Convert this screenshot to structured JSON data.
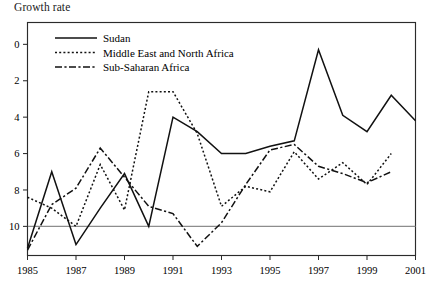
{
  "chart_data": {
    "type": "line",
    "title": "Growth rate",
    "xlabel": "",
    "ylabel": "",
    "xlim": [
      1985,
      2001
    ],
    "ylim": [
      -1.6,
      11.2
    ],
    "yticks": [
      0,
      2,
      4,
      6,
      8,
      10
    ],
    "xticks": [
      1985,
      1987,
      1989,
      1991,
      1993,
      1995,
      1997,
      1999,
      2001
    ],
    "grid": false,
    "legend_position": "top-left",
    "zero_line": 0,
    "x": [
      1985,
      1986,
      1987,
      1988,
      1989,
      1990,
      1991,
      1992,
      1993,
      1994,
      1995,
      1996,
      1997,
      1998,
      1999,
      2000,
      2001
    ],
    "series": [
      {
        "name": "Sudan",
        "style": "solid",
        "values": [
          -1.2,
          3.0,
          -1.0,
          1.0,
          2.9,
          0.0,
          6.0,
          5.2,
          4.0,
          4.0,
          4.4,
          4.7,
          9.7,
          6.1,
          5.2,
          7.2,
          5.8
        ]
      },
      {
        "name": "Middle East and North Africa",
        "style": "dotted",
        "values": [
          1.6,
          1.0,
          0.0,
          3.4,
          0.9,
          7.4,
          7.4,
          5.1,
          1.1,
          2.2,
          1.9,
          4.1,
          2.6,
          3.5,
          2.3,
          4.0,
          null
        ]
      },
      {
        "name": "Sub-Saharan Africa",
        "style": "dashdot",
        "values": [
          -1.3,
          1.2,
          2.1,
          4.3,
          2.7,
          1.1,
          0.7,
          -1.1,
          0.2,
          2.3,
          4.2,
          4.5,
          3.3,
          2.9,
          2.4,
          3.0,
          null
        ]
      }
    ]
  },
  "legend": {
    "entries": [
      {
        "label": "Sudan"
      },
      {
        "label": "Middle East and North Africa"
      },
      {
        "label": "Sub-Saharan Africa"
      }
    ]
  },
  "ytick_labels": [
    "10",
    "8",
    "6",
    "4",
    "2",
    "0"
  ],
  "xtick_labels": [
    "1985",
    "1987",
    "1989",
    "1991",
    "1993",
    "1995",
    "1997",
    "1999",
    "2001"
  ],
  "source_note": ""
}
